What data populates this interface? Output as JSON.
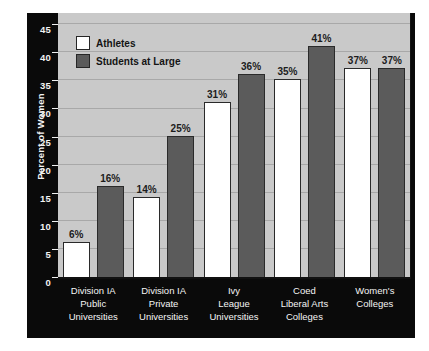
{
  "chart_data": {
    "type": "bar",
    "title": "",
    "xlabel": "",
    "ylabel": "Percent of Women",
    "ylim": [
      0,
      47
    ],
    "yticks": [
      0,
      5,
      10,
      15,
      20,
      25,
      30,
      35,
      40,
      45
    ],
    "ytick_labels": [
      "0",
      "5",
      "10",
      "15",
      "20",
      "25",
      "30",
      "35",
      "40",
      "45"
    ],
    "grid": true,
    "legend_position": "top-left-inside",
    "categories": [
      [
        "Division IA",
        "Public",
        "Universities"
      ],
      [
        "Division IA",
        "Private",
        "Universities"
      ],
      [
        "Ivy",
        "League",
        "Universities"
      ],
      [
        "Coed",
        "Liberal Arts",
        "Colleges"
      ],
      [
        "Women's",
        "Colleges"
      ]
    ],
    "series": [
      {
        "name": "Athletes",
        "color": "#ffffff",
        "values": [
          6,
          14,
          31,
          35,
          37
        ],
        "labels": [
          "6%",
          "14%",
          "31%",
          "35%",
          "37%"
        ]
      },
      {
        "name": "Students at Large",
        "color": "#5b5b5b",
        "values": [
          16,
          25,
          36,
          41,
          37
        ],
        "labels": [
          "16%",
          "25%",
          "36%",
          "41%",
          "37%"
        ]
      }
    ]
  },
  "colors": {
    "plot_background": "#c9c9c9",
    "panel_background": "#0a0a0a",
    "gridline": "#a8a8a8",
    "axis_text": "#f4f4f4",
    "value_text": "#1c1c1c"
  }
}
